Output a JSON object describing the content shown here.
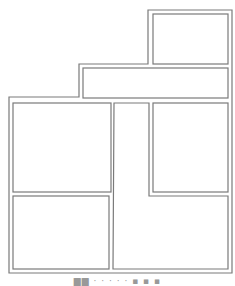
{
  "diagram": {
    "type": "floor-plan-layout",
    "line_color": "#7a7a7a",
    "background": "#ffffff",
    "outline": {
      "points": [
        [
          148,
          10
        ],
        [
          232,
          10
        ],
        [
          232,
          273
        ],
        [
          9,
          273
        ],
        [
          9,
          97
        ],
        [
          79,
          97
        ],
        [
          79,
          64
        ],
        [
          148,
          64
        ]
      ]
    },
    "panels": [
      {
        "id": "top-right",
        "x": 153,
        "y": 14,
        "w": 75,
        "h": 50
      },
      {
        "id": "middle-band",
        "x": 83,
        "y": 68,
        "w": 145,
        "h": 30
      },
      {
        "id": "left-upper",
        "x": 13,
        "y": 103,
        "w": 98,
        "h": 89
      },
      {
        "id": "right-upper",
        "x": 153,
        "y": 103,
        "w": 75,
        "h": 89
      },
      {
        "id": "left-lower",
        "x": 13,
        "y": 196,
        "w": 96,
        "h": 73
      }
    ],
    "l_panel": {
      "id": "l-shaped-corridor",
      "points": [
        [
          114,
          103
        ],
        [
          149,
          103
        ],
        [
          149,
          196
        ],
        [
          228,
          196
        ],
        [
          228,
          269
        ],
        [
          113,
          269
        ]
      ]
    }
  },
  "caption": {
    "text": "▆▆ · · ·   · · ▪ ▪ ▪"
  }
}
